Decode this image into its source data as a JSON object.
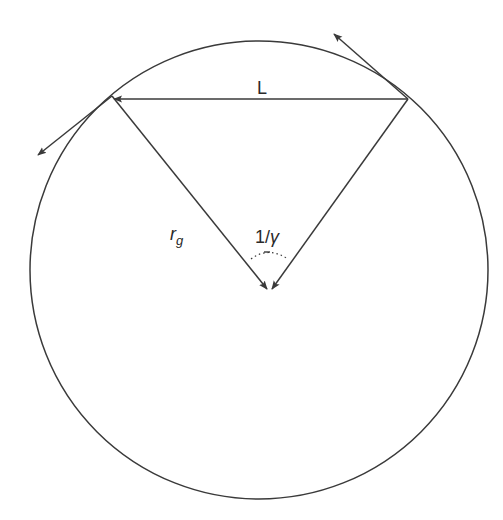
{
  "diagram": {
    "labels": {
      "chord": "L",
      "radius_main": "r",
      "radius_sub": "g",
      "angle_num": "1/",
      "angle_sym": "γ"
    },
    "colors": {
      "stroke": "#3a3a3a",
      "background": "#ffffff"
    },
    "geometry": {
      "circle_center": [
        259,
        270
      ],
      "circle_radius": 229,
      "left_point": [
        112,
        97
      ],
      "right_point": [
        408,
        99
      ],
      "apex_point": [
        269,
        291
      ]
    }
  }
}
